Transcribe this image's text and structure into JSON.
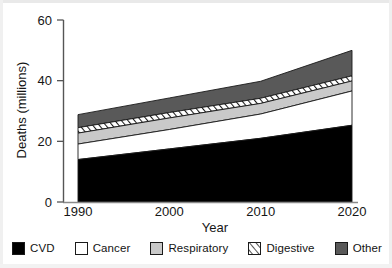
{
  "chart_data": {
    "type": "area",
    "title": "",
    "xlabel": "Year",
    "ylabel": "Deaths (millions)",
    "xlim": [
      1990,
      2020
    ],
    "ylim": [
      0,
      60
    ],
    "xticks": [
      1990,
      2000,
      2010,
      2020
    ],
    "yticks": [
      0,
      20,
      40,
      60
    ],
    "xtick_labels": [
      "1990",
      "2000",
      "2010",
      "2020"
    ],
    "ytick_labels": [
      "0",
      "20",
      "40",
      "60"
    ],
    "grid": false,
    "stacked": true,
    "legend_position": "below",
    "x": [
      1990,
      2000,
      2010,
      2020
    ],
    "series": [
      {
        "name": "CVD",
        "values": [
          14.0,
          17.5,
          21.0,
          25.3
        ],
        "color": "#000000",
        "pattern": "solid"
      },
      {
        "name": "Cancer",
        "values": [
          5.1,
          6.4,
          8.0,
          11.3
        ],
        "color": "#ffffff",
        "pattern": "solid"
      },
      {
        "name": "Respiratory",
        "values": [
          3.6,
          3.8,
          3.5,
          3.3
        ],
        "color": "#c9c9c9",
        "pattern": "solid"
      },
      {
        "name": "Digestive",
        "values": [
          1.8,
          1.8,
          1.7,
          1.7
        ],
        "color": "#ffffff",
        "pattern": "diagonal-hatch"
      },
      {
        "name": "Other",
        "values": [
          4.3,
          4.8,
          5.6,
          8.4
        ],
        "color": "#595959",
        "pattern": "solid"
      }
    ],
    "cumulative_tops": {
      "CVD": [
        14.0,
        17.5,
        21.0,
        25.3
      ],
      "Cancer": [
        19.1,
        23.9,
        29.0,
        36.6
      ],
      "Respiratory": [
        22.7,
        27.7,
        32.5,
        39.9
      ],
      "Digestive": [
        24.5,
        29.5,
        34.2,
        41.6
      ],
      "Other": [
        28.8,
        34.3,
        39.8,
        50.0
      ]
    }
  },
  "axes": {
    "y_title": "Deaths (millions)",
    "x_title": "Year",
    "y_labels": [
      "60",
      "40",
      "20",
      "0"
    ],
    "x_labels": [
      "1990",
      "2000",
      "2010",
      "2020"
    ]
  },
  "legend": {
    "items": [
      {
        "label": "CVD",
        "swatch": "swatch-black-solid"
      },
      {
        "label": "Cancer",
        "swatch": "swatch-white-solid"
      },
      {
        "label": "Respiratory",
        "swatch": "swatch-lightgray-solid"
      },
      {
        "label": "Digestive",
        "swatch": "swatch-white-hatched"
      },
      {
        "label": "Other",
        "swatch": "swatch-darkgray-solid"
      }
    ]
  }
}
